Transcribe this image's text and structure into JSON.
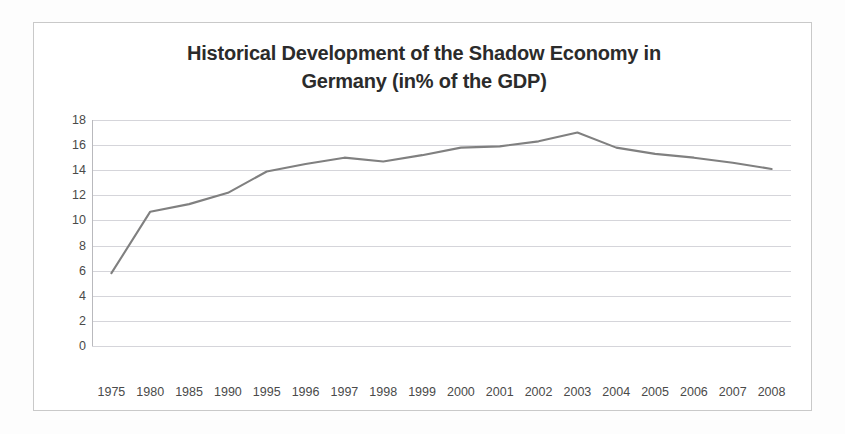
{
  "chart_data": {
    "type": "line",
    "title": "Historical Development of the Shadow Economy in Germany (in% of the GDP)",
    "title_line1": "Historical Development of the Shadow Economy in",
    "title_line2": "Germany (in% of the GDP)",
    "xlabel": "",
    "ylabel": "",
    "ylim": [
      0,
      18
    ],
    "ytick_step": 2,
    "yticks": [
      "18",
      "16",
      "14",
      "12",
      "10",
      "8",
      "6",
      "4",
      "2",
      "0"
    ],
    "ytick_values": [
      18,
      16,
      14,
      12,
      10,
      8,
      6,
      4,
      2,
      0
    ],
    "grid": true,
    "legend": false,
    "legend_position": "none",
    "line_color": "#808080",
    "grid_color": "#d5d5da",
    "axis_color": "#b9b9bd",
    "text_color": "#4a4a4a",
    "title_color": "#2b2b2b",
    "categories": [
      "1975",
      "1980",
      "1985",
      "1990",
      "1995",
      "1996",
      "1997",
      "1998",
      "1999",
      "2000",
      "2001",
      "2002",
      "2003",
      "2004",
      "2005",
      "2006",
      "2007",
      "2008"
    ],
    "values": [
      5.8,
      10.7,
      11.3,
      12.2,
      13.9,
      14.5,
      15.0,
      14.7,
      15.2,
      15.8,
      15.9,
      16.3,
      17.0,
      15.8,
      15.3,
      15.0,
      14.6,
      14.1
    ],
    "series": [
      {
        "name": "Shadow Economy (% of GDP)",
        "values": [
          5.8,
          10.7,
          11.3,
          12.2,
          13.9,
          14.5,
          15.0,
          14.7,
          15.2,
          15.8,
          15.9,
          16.3,
          17.0,
          15.8,
          15.3,
          15.0,
          14.6,
          14.1
        ]
      }
    ]
  }
}
